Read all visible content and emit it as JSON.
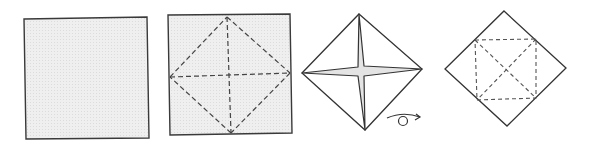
{
  "diagram": {
    "title": "",
    "colors": {
      "paper_fill": "#eeeeee",
      "outline": "#333333",
      "crease": "#444444",
      "background": "#ffffff"
    },
    "steps": [
      {
        "id": 1,
        "label": "blank-square",
        "shape": "square",
        "points": [
          [
            24,
            19
          ],
          [
            147,
            17
          ],
          [
            149,
            138
          ],
          [
            26,
            139
          ]
        ],
        "shaded": true
      },
      {
        "id": 2,
        "label": "square-with-crease-lines",
        "shape": "square",
        "points": [
          [
            168,
            15
          ],
          [
            290,
            14
          ],
          [
            292,
            133
          ],
          [
            170,
            135
          ]
        ],
        "shaded": true,
        "valley_folds": [
          [
            [
              227,
              17
            ],
            [
              290,
              73
            ]
          ],
          [
            [
              290,
              73
            ],
            [
              231,
              133
            ]
          ],
          [
            [
              231,
              133
            ],
            [
              170,
              77
            ]
          ],
          [
            [
              170,
              77
            ],
            [
              227,
              17
            ]
          ],
          [
            [
              170,
              77
            ],
            [
              290,
              73
            ]
          ],
          [
            [
              227,
              17
            ],
            [
              231,
              133
            ]
          ]
        ]
      },
      {
        "id": 3,
        "label": "collapsed-base-with-star",
        "shape": "diamond",
        "points": [
          [
            359,
            14
          ],
          [
            422,
            69
          ],
          [
            365,
            130
          ],
          [
            302,
            73
          ]
        ],
        "shaded": false,
        "center": [
          362,
          71
        ]
      },
      {
        "id": 4,
        "label": "turned-over-diamond-with-creases",
        "shape": "diamond",
        "points": [
          [
            504,
            11
          ],
          [
            566,
            68
          ],
          [
            507,
            126
          ],
          [
            445,
            69
          ]
        ],
        "shaded": false,
        "inner_square": [
          [
            475,
            40
          ],
          [
            536,
            39
          ],
          [
            536,
            98
          ],
          [
            477,
            100
          ]
        ]
      }
    ],
    "symbols": [
      {
        "name": "turn-over",
        "position": [
          387,
          113
        ],
        "meaning": "turn the model over"
      }
    ]
  }
}
